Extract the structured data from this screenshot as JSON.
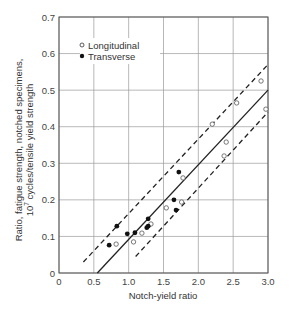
{
  "chart_data": {
    "type": "scatter",
    "title": "",
    "xlabel": "Notch-yield ratio",
    "ylabel_line1": "Ratio, fatigue strength, notched specimens,",
    "ylabel_line2_pre": "10",
    "ylabel_line2_sup": "7",
    "ylabel_line2_post": " cycles/tensile yield strength",
    "xlim": [
      0,
      3.0
    ],
    "ylim": [
      0,
      0.7
    ],
    "xticks": [
      0,
      0.5,
      1.0,
      1.5,
      2.0,
      2.5,
      3.0
    ],
    "xtick_labels": [
      "0",
      "0.5",
      "1.0",
      "1.5",
      "2.0",
      "2.5",
      "3.0"
    ],
    "yticks": [
      0,
      0.1,
      0.2,
      0.3,
      0.4,
      0.5,
      0.6,
      0.7
    ],
    "ytick_labels": [
      "0",
      "0.1",
      "0.2",
      "0.3",
      "0.4",
      "0.5",
      "0.6",
      "0.7"
    ],
    "grid": true,
    "legend": {
      "position": "upper-left",
      "entries": [
        {
          "label": "Longitudinal",
          "marker": "open-circle"
        },
        {
          "label": "Transverse",
          "marker": "filled-circle"
        }
      ]
    },
    "series": [
      {
        "name": "Longitudinal",
        "marker": "open-circle",
        "points": [
          [
            0.82,
            0.079
          ],
          [
            1.07,
            0.085
          ],
          [
            1.19,
            0.109
          ],
          [
            1.32,
            0.134
          ],
          [
            1.54,
            0.178
          ],
          [
            1.76,
            0.194
          ],
          [
            1.78,
            0.26
          ],
          [
            2.2,
            0.407
          ],
          [
            2.37,
            0.32
          ],
          [
            2.4,
            0.358
          ],
          [
            2.55,
            0.465
          ],
          [
            2.9,
            0.525
          ],
          [
            2.97,
            0.448
          ]
        ]
      },
      {
        "name": "Transverse",
        "marker": "filled-circle",
        "points": [
          [
            0.72,
            0.076
          ],
          [
            0.83,
            0.128
          ],
          [
            0.98,
            0.107
          ],
          [
            1.09,
            0.11
          ],
          [
            1.28,
            0.148
          ],
          [
            1.28,
            0.128
          ],
          [
            1.26,
            0.124
          ],
          [
            1.65,
            0.2
          ],
          [
            1.68,
            0.172
          ],
          [
            1.72,
            0.276
          ]
        ]
      }
    ],
    "lines": [
      {
        "name": "mean-fit",
        "style": "solid",
        "from": [
          0.55,
          0
        ],
        "to": [
          3.0,
          0.5
        ]
      },
      {
        "name": "upper-bound",
        "style": "dashed",
        "from": [
          0.35,
          0.03
        ],
        "to": [
          3.0,
          0.57
        ]
      },
      {
        "name": "lower-bound",
        "style": "dashed",
        "from": [
          1.1,
          0.045
        ],
        "to": [
          3.0,
          0.44
        ]
      }
    ]
  }
}
